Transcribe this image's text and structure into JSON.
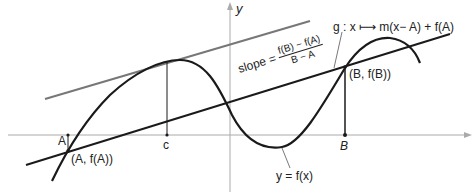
{
  "diagram": {
    "axes": {
      "x_label": "",
      "y_label": "y"
    },
    "points": {
      "A": "A",
      "c": "c",
      "B": "B",
      "A_point": "(A, f(A))",
      "B_point": "(B, f(B))"
    },
    "labels": {
      "function": "y = f(x)",
      "secant_map": "g : x ⟼ m(x− A) + f(A)",
      "slope_prefix": "slope =",
      "slope_num": "f(B) − f(A)",
      "slope_den": "B − A"
    },
    "colors": {
      "curve": "#1a1a1a",
      "tangent": "#777777",
      "axis": "#aaaaaa"
    }
  }
}
